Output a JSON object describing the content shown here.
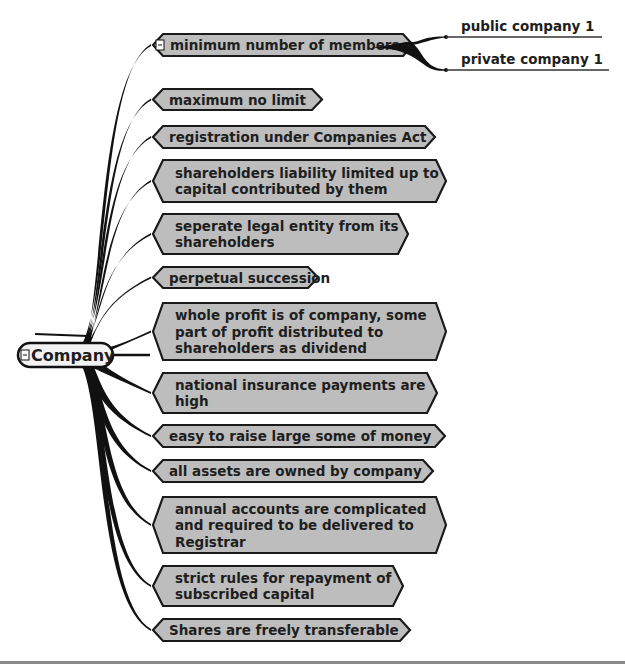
{
  "root": {
    "label": "Company",
    "collapse_icon": "minus-box-icon"
  },
  "colors": {
    "node_fill": "#bdbdbd",
    "node_border": "#1a1a1a",
    "branch": "#111111",
    "root_fill": "#f2f2f2",
    "background": "#ffffff"
  },
  "nodes": [
    {
      "lines": [
        "minimum number of members"
      ],
      "has_toggle": true,
      "children": [
        "public company 1",
        "private company 1"
      ]
    },
    {
      "lines": [
        "maximum no limit"
      ]
    },
    {
      "lines": [
        "registration under Companies Act"
      ]
    },
    {
      "lines": [
        "shareholders liability limited up to",
        "capital contributed by them"
      ]
    },
    {
      "lines": [
        "seperate legal entity from its",
        "shareholders"
      ]
    },
    {
      "lines": [
        "perpetual succession"
      ]
    },
    {
      "lines": [
        "whole profit is of company, some",
        "part of profit distributed to",
        "shareholders as dividend"
      ]
    },
    {
      "lines": [
        "national insurance payments are",
        "high"
      ]
    },
    {
      "lines": [
        "easy to raise large some of money"
      ]
    },
    {
      "lines": [
        "all assets are owned by company"
      ]
    },
    {
      "lines": [
        "annual accounts are complicated",
        "and required to be delivered to",
        "Registrar"
      ]
    },
    {
      "lines": [
        "strict rules for repayment of",
        "subscribed capital"
      ]
    },
    {
      "lines": [
        "Shares are freely transferable"
      ]
    }
  ]
}
